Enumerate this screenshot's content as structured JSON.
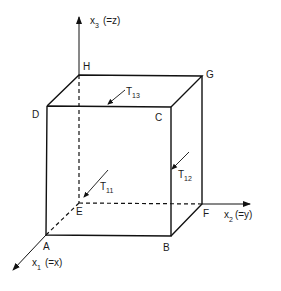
{
  "diagram": {
    "axes": {
      "x1": {
        "label": "x",
        "subscript": "1",
        "suffix": "(=x)"
      },
      "x2": {
        "label": "x",
        "subscript": "2",
        "suffix": "(=y)"
      },
      "x3": {
        "label": "x",
        "subscript": "3",
        "suffix": "(=z)"
      }
    },
    "vertices": {
      "A": "A",
      "B": "B",
      "C": "C",
      "D": "D",
      "E": "E",
      "F": "F",
      "G": "G",
      "H": "H"
    },
    "stresses": {
      "t11": {
        "label": "T",
        "subscript": "11"
      },
      "t12": {
        "label": "T",
        "subscript": "12"
      },
      "t13": {
        "label": "T",
        "subscript": "13"
      }
    },
    "colors": {
      "ink": "#111111",
      "background": "#ffffff"
    }
  }
}
